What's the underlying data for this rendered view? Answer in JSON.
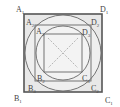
{
  "diagram": {
    "labels": {
      "A1": "A",
      "A1_sub": "1",
      "D1": "D",
      "D1_sub": "1",
      "B1": "B",
      "B1_sub": "1",
      "C1": "C",
      "C1_sub": "1",
      "A2": "A",
      "A2_sub": "2",
      "D2": "D",
      "D2_sub": "2",
      "B2": "B",
      "B2_sub": "2",
      "C2": "C",
      "C2_sub": "2",
      "A3": "A",
      "A3_sub": "3",
      "D3": "D",
      "D3_sub": "3",
      "B3": "B",
      "B3_sub": "3",
      "C3": "C",
      "C3_sub": "3"
    },
    "colors": {
      "stroke": "#555555",
      "fill": "#e6e6e6",
      "diag": "#999999"
    }
  }
}
